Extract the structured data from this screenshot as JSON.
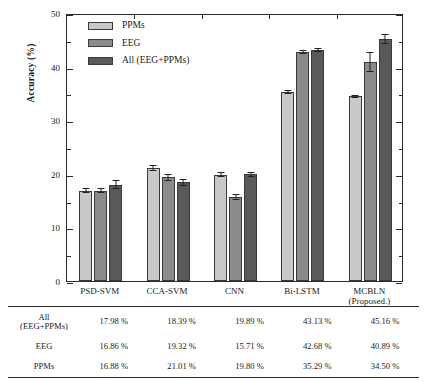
{
  "chart_data": {
    "type": "bar",
    "title": "",
    "xlabel": "",
    "ylabel": "Accuracy (%)",
    "ylim": [
      0,
      50
    ],
    "ytick_labels": [
      "0",
      "10",
      "20",
      "30",
      "40",
      "50"
    ],
    "ytick_values": [
      0,
      10,
      20,
      30,
      40,
      50
    ],
    "minor_tick_values": [
      5,
      15,
      25,
      35,
      45
    ],
    "grid": false,
    "legend_position": "upper-left-inside",
    "categories": [
      "PSD-SVM",
      "CCA-SVM",
      "CNN",
      "Bi-LSTM",
      "MCBLN (Proposed.)"
    ],
    "category_lines": [
      [
        "PSD-SVM"
      ],
      [
        "CCA-SVM"
      ],
      [
        "CNN"
      ],
      [
        "Bi-LSTM"
      ],
      [
        "MCBLN",
        "(Proposed.)"
      ]
    ],
    "series": [
      {
        "name": "PPMs",
        "color": "#c9c9c9",
        "values": [
          16.88,
          21.01,
          19.8,
          35.29,
          34.5
        ],
        "errors": [
          0.55,
          0.55,
          0.45,
          0.35,
          0.3
        ]
      },
      {
        "name": "EEG",
        "color": "#8b8b8b",
        "values": [
          16.86,
          19.32,
          15.71,
          42.68,
          40.89
        ],
        "errors": [
          0.45,
          0.6,
          0.55,
          0.35,
          1.9
        ]
      },
      {
        "name": "All (EEG+PPMs)",
        "color": "#595959",
        "values": [
          17.98,
          18.39,
          19.89,
          43.13,
          45.16
        ],
        "errors": [
          0.85,
          0.65,
          0.4,
          0.35,
          0.95
        ]
      }
    ]
  },
  "legend": {
    "items": [
      {
        "label": "PPMs",
        "color": "#c9c9c9"
      },
      {
        "label": "EEG",
        "color": "#8b8b8b"
      },
      {
        "label": "All (EEG+PPMs)",
        "color": "#595959"
      }
    ]
  },
  "table": {
    "column_headers": [
      "",
      "PSD-SVM",
      "CCA-SVM",
      "CNN",
      "Bi-LSTM",
      "MCBLN (Proposed.)"
    ],
    "rows": [
      {
        "label_lines": [
          "All",
          "(EEG+PPMs)"
        ],
        "values": [
          "17.98 %",
          "18.39 %",
          "19.89 %",
          "43.13 %",
          "45.16 %"
        ]
      },
      {
        "label_lines": [
          "EEG"
        ],
        "values": [
          "16.86 %",
          "19.32 %",
          "15.71 %",
          "42.68 %",
          "40.89 %"
        ]
      },
      {
        "label_lines": [
          "PPMs"
        ],
        "values": [
          "16.88 %",
          "21.01 %",
          "19.80 %",
          "35.29 %",
          "34.50 %"
        ]
      }
    ]
  },
  "colors": {
    "axis": "#2b2b2b",
    "background": "#ffffff",
    "text": "#1a1a1a"
  }
}
